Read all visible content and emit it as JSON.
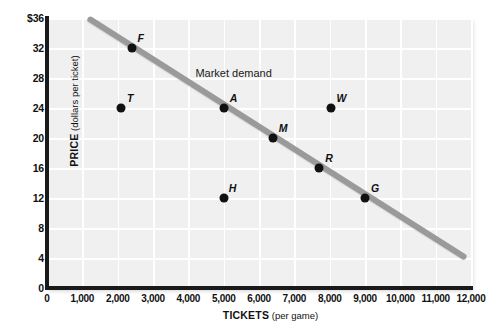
{
  "chart_data": {
    "type": "scatter",
    "title": "",
    "xlabel": "TICKETS (per game)",
    "xlabel_bold": "TICKETS",
    "xlabel_paren": "(per game)",
    "ylabel": "PRICE (dollars per ticket)",
    "ylabel_bold": "PRICE",
    "ylabel_paren": "(dollars per ticket)",
    "xlim": [
      0,
      12000
    ],
    "ylim": [
      0,
      36
    ],
    "grid": true,
    "legend": "none",
    "annotations": [
      {
        "text": "Market demand",
        "x": 4200,
        "y": 28.4
      }
    ],
    "xticks": [
      {
        "value": 0,
        "label": "0"
      },
      {
        "value": 1000,
        "label": "1,000"
      },
      {
        "value": 2000,
        "label": "2,000"
      },
      {
        "value": 3000,
        "label": "3,000"
      },
      {
        "value": 4000,
        "label": "4,000"
      },
      {
        "value": 5000,
        "label": "5,000"
      },
      {
        "value": 6000,
        "label": "6,000"
      },
      {
        "value": 7000,
        "label": "7,000"
      },
      {
        "value": 8000,
        "label": "8,000"
      },
      {
        "value": 9000,
        "label": "9,000"
      },
      {
        "value": 10000,
        "label": "10,000"
      },
      {
        "value": 11000,
        "label": "11,000"
      },
      {
        "value": 12000,
        "label": "12,000"
      }
    ],
    "yticks": [
      {
        "value": 0,
        "label": "0"
      },
      {
        "value": 4,
        "label": "4"
      },
      {
        "value": 8,
        "label": "8"
      },
      {
        "value": 12,
        "label": "12"
      },
      {
        "value": 16,
        "label": "16"
      },
      {
        "value": 20,
        "label": "20"
      },
      {
        "value": 24,
        "label": "24"
      },
      {
        "value": 28,
        "label": "28"
      },
      {
        "value": 32,
        "label": "32"
      },
      {
        "value": 36,
        "label": "$36"
      }
    ],
    "series": [
      {
        "name": "Market demand",
        "type": "line",
        "color": "#9a9a9a",
        "x": [
          1150,
          11850
        ],
        "y": [
          36,
          4
        ]
      },
      {
        "name": "Labeled points",
        "type": "scatter",
        "color": "#111111",
        "points": [
          {
            "label": "F",
            "x": 2400,
            "y": 32,
            "label_dx": 9,
            "label_dy": -10
          },
          {
            "label": "T",
            "x": 2100,
            "y": 24,
            "label_dx": 9,
            "label_dy": -10
          },
          {
            "label": "A",
            "x": 5000,
            "y": 24,
            "label_dx": 10,
            "label_dy": -10
          },
          {
            "label": "M",
            "x": 6400,
            "y": 20,
            "label_dx": 10,
            "label_dy": -10
          },
          {
            "label": "W",
            "x": 8050,
            "y": 24,
            "label_dx": 10,
            "label_dy": -10
          },
          {
            "label": "H",
            "x": 5000,
            "y": 12,
            "label_dx": 9,
            "label_dy": -10
          },
          {
            "label": "R",
            "x": 7700,
            "y": 16,
            "label_dx": 10,
            "label_dy": -10
          },
          {
            "label": "G",
            "x": 9000,
            "y": 12,
            "label_dx": 10,
            "label_dy": -10
          }
        ]
      }
    ]
  }
}
